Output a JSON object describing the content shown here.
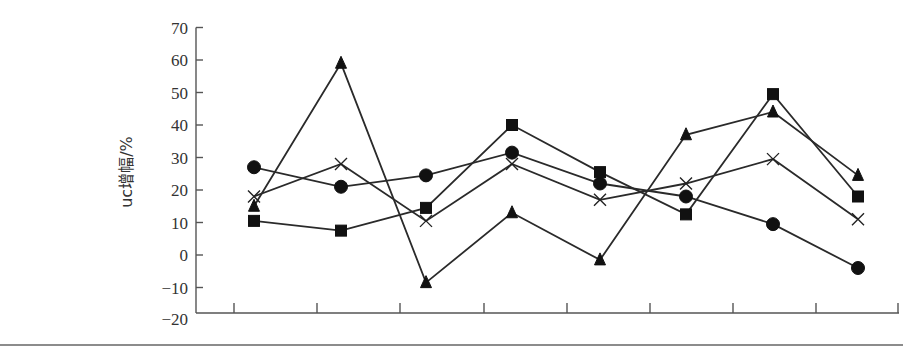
{
  "chart_data": {
    "type": "line",
    "title": "",
    "xlabel": "",
    "ylabel": "uc增幅/%",
    "ylim": [
      -20,
      70
    ],
    "yticks": [
      70,
      60,
      50,
      40,
      30,
      20,
      10,
      0,
      -10,
      -20
    ],
    "x": [
      1,
      2,
      3,
      4,
      5,
      6,
      7,
      8
    ],
    "x_tick_labels": [],
    "grid": false,
    "legend": "none",
    "series": [
      {
        "name": "circle",
        "marker": "circle",
        "values": [
          27,
          21,
          24.5,
          31.5,
          22,
          18,
          9.5,
          -4
        ]
      },
      {
        "name": "square",
        "marker": "square",
        "values": [
          10.5,
          7.5,
          14.5,
          40,
          25.5,
          12.5,
          49.5,
          18
        ]
      },
      {
        "name": "triangle",
        "marker": "triangle",
        "values": [
          15,
          59,
          -8.5,
          13,
          -1.5,
          37,
          44,
          24.5
        ]
      },
      {
        "name": "cross",
        "marker": "x",
        "values": [
          18,
          28,
          10.5,
          28,
          17,
          22,
          29.5,
          11
        ]
      }
    ]
  },
  "colors": {
    "line": "#2a2a2a",
    "marker": "#111111",
    "axis": "#555555"
  }
}
